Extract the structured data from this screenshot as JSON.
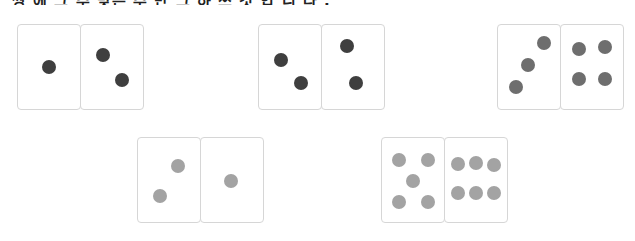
{
  "header": {
    "clipped_text": "쌍 에 그 수 맞는 수 만 그 하 쓰 것 입 니 다 ."
  },
  "colors": {
    "dark_pip": "#3f3f3f",
    "mid_pip": "#6e6e6e",
    "light_pip": "#a3a3a3",
    "border": "#d6d6d6"
  },
  "dominoes": [
    {
      "id": 1,
      "left": 1,
      "right": 2,
      "shade": "dark"
    },
    {
      "id": 2,
      "left": 2,
      "right": 2,
      "shade": "dark"
    },
    {
      "id": 3,
      "left": 3,
      "right": 4,
      "shade": "mid"
    },
    {
      "id": 4,
      "left": 2,
      "right": 1,
      "shade": "light"
    },
    {
      "id": 5,
      "left": 5,
      "right": 6,
      "shade": "light"
    }
  ]
}
